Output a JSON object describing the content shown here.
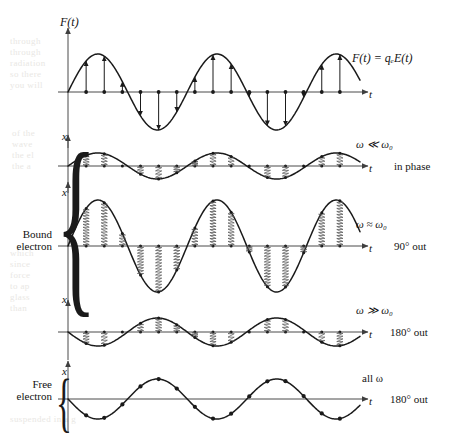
{
  "figure": {
    "caption_present": false,
    "axis_x_label": "t",
    "axis_y_label_force": "F(t)",
    "axis_y_label_displacement": "x"
  },
  "colors": {
    "ink": "#141414",
    "curve": "#1a1a1a",
    "axis": "#4a4a4a",
    "spring": "#555555",
    "bleed": "#e9e7e4"
  },
  "group_labels": {
    "bound": {
      "line1": "Bound",
      "line2": "electron"
    },
    "free": {
      "line1": "Free",
      "line2": "electron"
    }
  },
  "panels": [
    {
      "id": "driving-force",
      "y_axis_label": "F(t)",
      "x_axis_label": "t",
      "right_label_top": "",
      "right_label_bottom": "",
      "equation": "F(t) = qₑE(t)",
      "marker_style": "arrow",
      "amplitude": 38,
      "phase_deg": 0,
      "cycles": 2.5,
      "n_markers": 15
    },
    {
      "id": "omega-much-less",
      "y_axis_label": "x",
      "x_axis_label": "t",
      "right_label_top": "ω ≪ ω₀",
      "right_label_bottom": "in phase",
      "equation": "",
      "marker_style": "spring",
      "amplitude": 13,
      "phase_deg": 0,
      "cycles": 2.5,
      "n_markers": 15
    },
    {
      "id": "omega-approx",
      "y_axis_label": "x",
      "x_axis_label": "t",
      "right_label_top": "ω ≈ ω₀",
      "right_label_bottom": "90° out",
      "equation": "",
      "marker_style": "spring",
      "amplitude": 46,
      "phase_deg": 0,
      "cycles": 2.5,
      "n_markers": 15
    },
    {
      "id": "omega-much-greater",
      "y_axis_label": "x",
      "x_axis_label": "t",
      "right_label_top": "ω ≫ ω₀",
      "right_label_bottom": "180° out",
      "equation": "",
      "marker_style": "spring",
      "amplitude": 14,
      "phase_deg": 180,
      "cycles": 2.5,
      "n_markers": 15
    },
    {
      "id": "free-electron",
      "y_axis_label": "x",
      "x_axis_label": "t",
      "right_label_top": "all ω",
      "right_label_bottom": "180° out",
      "equation": "",
      "marker_style": "dot",
      "amplitude": 20,
      "phase_deg": 180,
      "cycles": 2.5,
      "n_markers": 15
    }
  ],
  "chart_data": {
    "type": "line",
    "title": "",
    "xlabel": "t",
    "ylabel": "F(t) / x",
    "grid": false,
    "legend": "none",
    "series": [
      {
        "name": "F(t) = qₑE(t)",
        "waveform": "sine",
        "amplitude": 38,
        "phase_deg": 0,
        "cycles": 2.5
      },
      {
        "name": "ω ≪ ω₀ (in phase)",
        "waveform": "sine",
        "amplitude": 13,
        "phase_deg": 0,
        "cycles": 2.5
      },
      {
        "name": "ω ≈ ω₀ (90° out)",
        "waveform": "sine",
        "amplitude": 46,
        "phase_deg": 0,
        "cycles": 2.5
      },
      {
        "name": "ω ≫ ω₀ (180° out)",
        "waveform": "sine",
        "amplitude": 14,
        "phase_deg": 180,
        "cycles": 2.5
      },
      {
        "name": "all ω (180° out)",
        "waveform": "sine",
        "amplitude": 20,
        "phase_deg": 180,
        "cycles": 2.5
      }
    ]
  },
  "bleed_text": {
    "block1": "through\nthrough\nradiation\nso there\nyou will",
    "block2": "of the\nwave\nthe el\nthe a",
    "block3": "which\nsince\nforce\nto ap\nglass\nthan",
    "block4": "suspended in a g"
  }
}
